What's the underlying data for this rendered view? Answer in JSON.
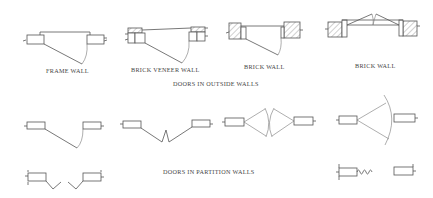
{
  "diagram": {
    "sections": [
      {
        "title": "DOORS IN OUTSIDE WALLS",
        "symbols": [
          {
            "label": "FRAME WALL"
          },
          {
            "label": "BRICK VENEER WALL"
          },
          {
            "label": "BRICK WALL"
          },
          {
            "label": "BRICK WALL"
          }
        ]
      },
      {
        "title": "DOORS IN PARTITION WALLS",
        "symbols": [
          {
            "type": "single-swing"
          },
          {
            "type": "bi-fold"
          },
          {
            "type": "double-acting-pair"
          },
          {
            "type": "double-acting-single"
          },
          {
            "type": "pair-bi-fold"
          },
          {
            "type": "accordion"
          }
        ]
      }
    ],
    "colors": {
      "line": "#555555",
      "background": "#ffffff"
    }
  }
}
